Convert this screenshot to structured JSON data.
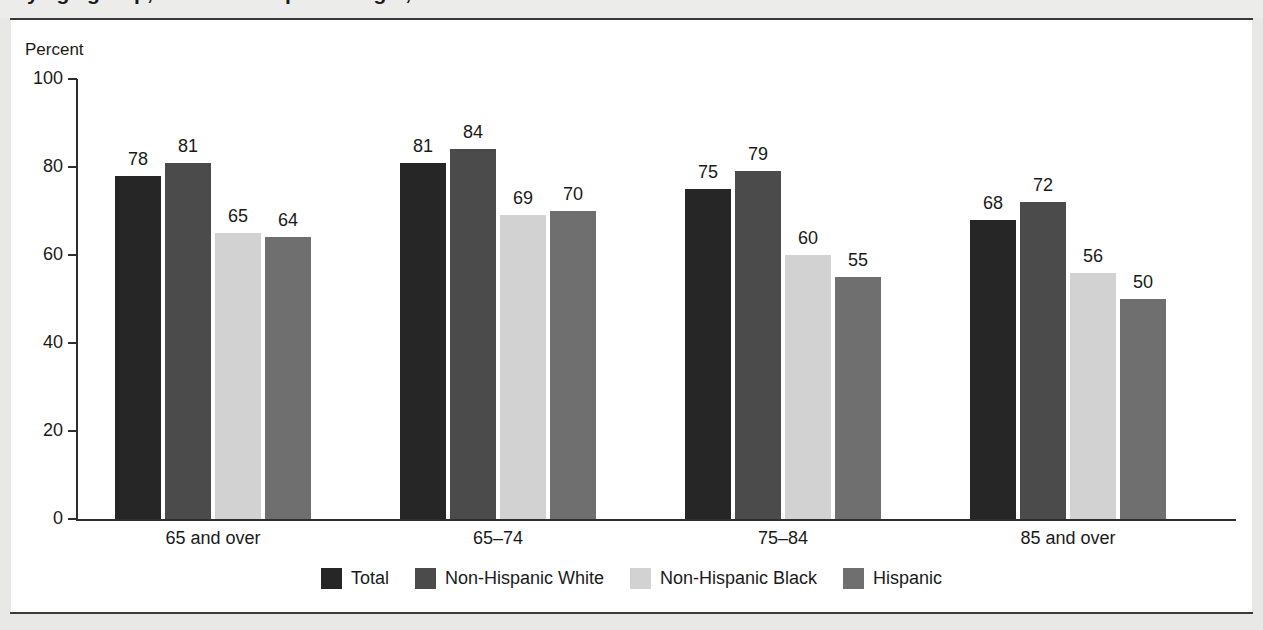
{
  "page": {
    "title_cropped": "by age group, race and Hispanic origin, 2013",
    "background_color": "#e8e8e6",
    "panel_color": "#ffffff",
    "rule_color": "#3a3a3a"
  },
  "chart_data": {
    "type": "bar",
    "title": "by age group, race and Hispanic origin, 2013",
    "xlabel": "",
    "ylabel": "Percent",
    "ylim": [
      0,
      100
    ],
    "yticks": [
      0,
      20,
      40,
      60,
      80,
      100
    ],
    "ytick_labels": [
      "0",
      "20",
      "40",
      "60",
      "80",
      "100"
    ],
    "grid": false,
    "legend_position": "bottom-center",
    "categories": [
      "65 and over",
      "65–74",
      "75–84",
      "85 and over"
    ],
    "series": [
      {
        "name": "Total",
        "color": "#262626",
        "values": [
          78,
          81,
          75,
          68
        ]
      },
      {
        "name": "Non-Hispanic White",
        "color": "#4b4b4b",
        "values": [
          81,
          84,
          79,
          72
        ]
      },
      {
        "name": "Non-Hispanic Black",
        "color": "#d2d2d2",
        "values": [
          65,
          69,
          60,
          56
        ]
      },
      {
        "name": "Hispanic",
        "color": "#6f6f6f",
        "values": [
          64,
          70,
          55,
          50
        ]
      }
    ]
  }
}
